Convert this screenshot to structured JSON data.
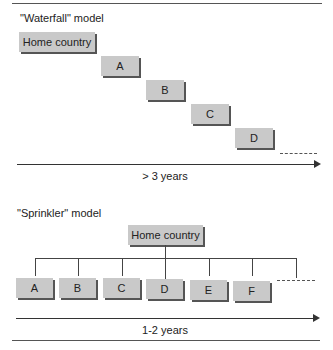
{
  "waterfall": {
    "title": "\"Waterfall\" model",
    "home_label": "Home country",
    "boxes": [
      "A",
      "B",
      "C",
      "D"
    ],
    "axis_label": "> 3 years"
  },
  "sprinkler": {
    "title": "\"Sprinkler\" model",
    "home_label": "Home country",
    "boxes": [
      "A",
      "B",
      "C",
      "D",
      "E",
      "F"
    ],
    "axis_label": "1-2 years"
  },
  "colors": {
    "box_fill": "#c9c9c9",
    "box_shadow": "#555555",
    "line": "#444444"
  }
}
